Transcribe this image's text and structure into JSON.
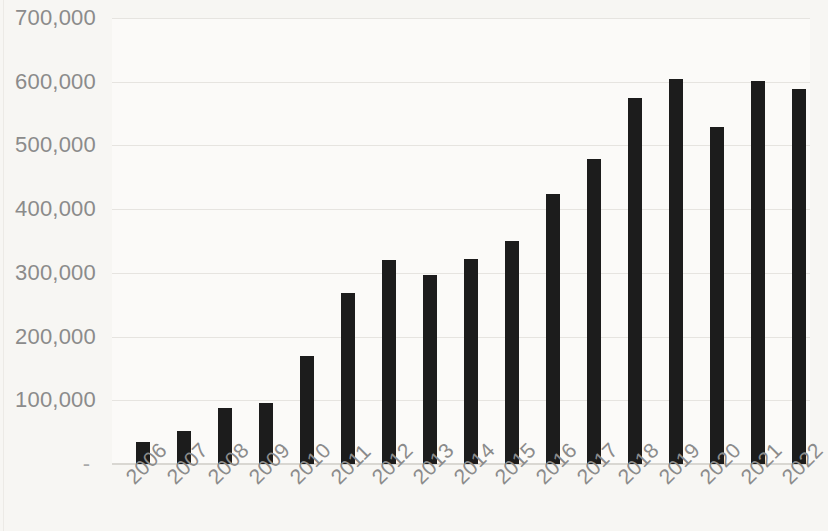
{
  "chart_data": {
    "type": "bar",
    "title": "",
    "subtitle": "",
    "xlabel": "",
    "ylabel": "",
    "categories": [
      "2006",
      "2007",
      "2008",
      "2009",
      "2010",
      "2011",
      "2012",
      "2013",
      "2014",
      "2015",
      "2016",
      "2017",
      "2018",
      "2019",
      "2020",
      "2021",
      "2022"
    ],
    "values": [
      35000,
      52000,
      88000,
      95000,
      170000,
      268000,
      320000,
      297000,
      322000,
      350000,
      424000,
      479000,
      575000,
      605000,
      529000,
      601000,
      589000
    ],
    "ylim": [
      0,
      700000
    ],
    "y_ticks": [
      0,
      100000,
      200000,
      300000,
      400000,
      500000,
      600000,
      700000
    ],
    "y_tick_labels": [
      "-",
      "100,000",
      "200,000",
      "300,000",
      "400,000",
      "500,000",
      "600,000",
      "700,000"
    ],
    "grid": true,
    "grid_axis": "y",
    "legend": false,
    "legend_position": "none",
    "series": [
      {
        "name": "",
        "color": "#1c1c1c",
        "values": [
          35000,
          52000,
          88000,
          95000,
          170000,
          268000,
          320000,
          297000,
          322000,
          350000,
          424000,
          479000,
          575000,
          605000,
          529000,
          601000,
          589000
        ]
      }
    ],
    "annotations": []
  },
  "colors": {
    "background": "#f7f6f3",
    "plot_background": "#fbfaf8",
    "bar": "#1c1c1c",
    "gridline": "#e6e4e0",
    "axis": "#d9d7d2",
    "tick_text": "#8b8b8b"
  }
}
